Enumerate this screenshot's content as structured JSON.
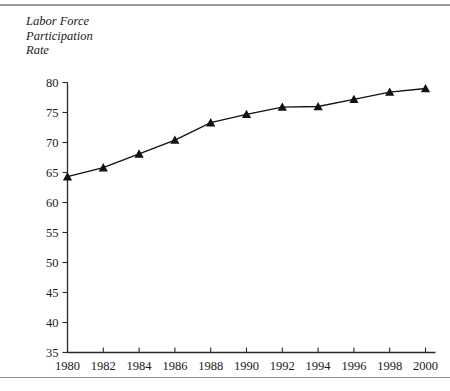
{
  "figure": {
    "y_axis_title": "Labor Force\nParticipation\nRate",
    "y_axis_title_lines": [
      "Labor Force",
      "Participation",
      "Rate"
    ]
  },
  "chart_data": {
    "type": "line",
    "title": "",
    "xlabel": "",
    "ylabel": "Labor Force Participation Rate",
    "x": [
      1980,
      1982,
      1984,
      1986,
      1988,
      1990,
      1992,
      1994,
      1996,
      1998,
      2000
    ],
    "xticklabels": [
      "1980",
      "1982",
      "1984",
      "1986",
      "1988",
      "1990",
      "1992",
      "1994",
      "1996",
      "1998",
      "2000"
    ],
    "yticks": [
      35,
      40,
      45,
      50,
      55,
      60,
      65,
      70,
      75,
      80
    ],
    "yticklabels": [
      "35",
      "40",
      "45",
      "50",
      "55",
      "60",
      "65",
      "70",
      "75",
      "80"
    ],
    "ylim": [
      35,
      80
    ],
    "xlim": [
      1980,
      2000
    ],
    "grid": false,
    "legend_position": "inline-annotations",
    "series": [
      {
        "name": "Children are age 6-17",
        "annotation": "Children are age 6–17",
        "annotation_superscript": "2",
        "marker": "triangle",
        "values": [
          64.3,
          65.8,
          68.1,
          70.4,
          73.3,
          74.7,
          75.9,
          76.0,
          77.2,
          78.4,
          79.0
        ],
        "value_labels": [
          "64.3",
          "65.8",
          "68.1",
          "70.4",
          "73.3",
          "74.7",
          "75.9",
          "76.0",
          "77.2",
          "78.4",
          "79.0"
        ]
      },
      {
        "name": "Children are under 6",
        "annotation": "Children are under 6",
        "marker": "circle",
        "values": [
          46.8,
          49.9,
          52.1,
          54.4,
          56.1,
          58.2,
          58.0,
          60.3,
          62.3,
          65.2,
          65.3
        ],
        "value_labels": [
          "46.8",
          "49.9",
          "52.1",
          "54.4",
          "56.1",
          "58.2",
          "58.0",
          "60.3",
          "62.3",
          "65.2",
          "65.3"
        ]
      },
      {
        "name": "Children are under 3",
        "annotation": "Children are under 3",
        "marker": "diamond",
        "values": [
          41.9,
          45.6,
          47.6,
          50.8,
          52.5,
          53.6,
          54.5,
          57.1,
          59.0,
          62.2,
          61.0
        ],
        "value_labels": [
          "41.9",
          "45.6",
          "47.6",
          "50.8",
          "52.5",
          "53.6",
          "54.5",
          "57.1",
          "59.0",
          "62.2",
          "61.0"
        ]
      }
    ]
  }
}
